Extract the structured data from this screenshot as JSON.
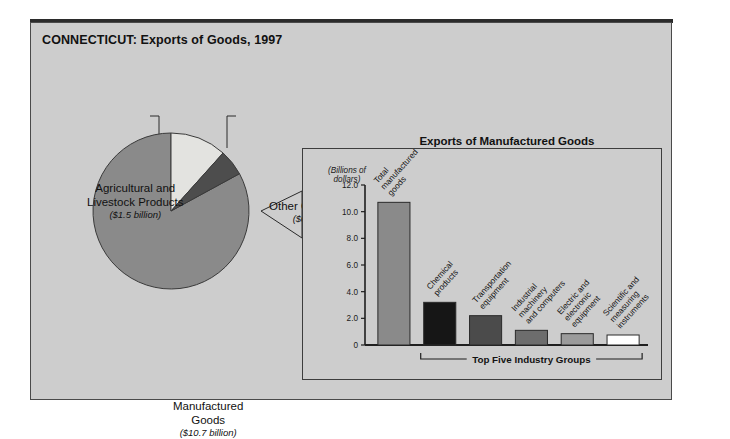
{
  "figure": {
    "title": "CONNECTICUT: Exports of Goods, 1997",
    "frame_color": "#cdcdcd",
    "border_color": "#4a4a4a"
  },
  "pie": {
    "labels": {
      "agricultural": {
        "name_line1": "Agricultural and",
        "name_line2": "Livestock Products",
        "amount": "($1.5 billion)"
      },
      "other": {
        "name_line1": "Other Commodities",
        "name_line2": "",
        "amount": "($0.7 billion)"
      },
      "manufactured": {
        "name_line1": "Manufactured",
        "name_line2": "Goods",
        "amount": "($10.7 billion)"
      }
    }
  },
  "inset": {
    "title": "Exports of Manufactured Goods",
    "unit_line1": "(Billions of",
    "unit_line2": "dollars)",
    "bracket_label": "Top Five Industry Groups"
  },
  "chart_data": [
    {
      "type": "pie",
      "title": "CONNECTICUT: Exports of Goods, 1997",
      "unit": "billions of dollars",
      "slices": [
        {
          "label": "Manufactured Goods",
          "value": 10.7,
          "display": "($10.7 billion)",
          "color": "#8a8a8a"
        },
        {
          "label": "Agricultural and Livestock Products",
          "value": 1.5,
          "display": "($1.5 billion)",
          "color": "#e3e3e0"
        },
        {
          "label": "Other Commodities",
          "value": 0.7,
          "display": "($0.7 billion)",
          "color": "#4d4d4d"
        }
      ],
      "total": 12.9,
      "legend_position": "callout-labels"
    },
    {
      "type": "bar",
      "title": "Exports of Manufactured Goods",
      "xlabel": "Top Five Industry Groups",
      "ylabel": "(Billions of dollars)",
      "ylim": [
        0,
        12.0
      ],
      "yticks": [
        "0",
        "2.0",
        "4.0",
        "6.0",
        "8.0",
        "10.0",
        "12.0"
      ],
      "ytick_values": [
        0,
        2,
        4,
        6,
        8,
        10,
        12
      ],
      "grid": false,
      "legend_position": "none",
      "categories": [
        "Total manufactured goods",
        "Chemical products",
        "Transportation equipment",
        "Industrial machinery and computers",
        "Electric and electronic equipment",
        "Scientific and measuring instruments"
      ],
      "category_lines": [
        [
          "Total",
          "manufactured",
          "goods"
        ],
        [
          "Chemical",
          "products"
        ],
        [
          "Transportation",
          "equipment"
        ],
        [
          "Industrial",
          "machinery",
          "and computers"
        ],
        [
          "Electric and",
          "electronic",
          "equipment"
        ],
        [
          "Scientific and",
          "measuring",
          "instruments"
        ]
      ],
      "values": [
        10.7,
        3.2,
        2.2,
        1.1,
        0.85,
        0.75
      ],
      "colors": [
        "#8a8a8a",
        "#161616",
        "#4b4b4b",
        "#6d6d6d",
        "#9b9b9b",
        "#ffffff"
      ]
    }
  ]
}
